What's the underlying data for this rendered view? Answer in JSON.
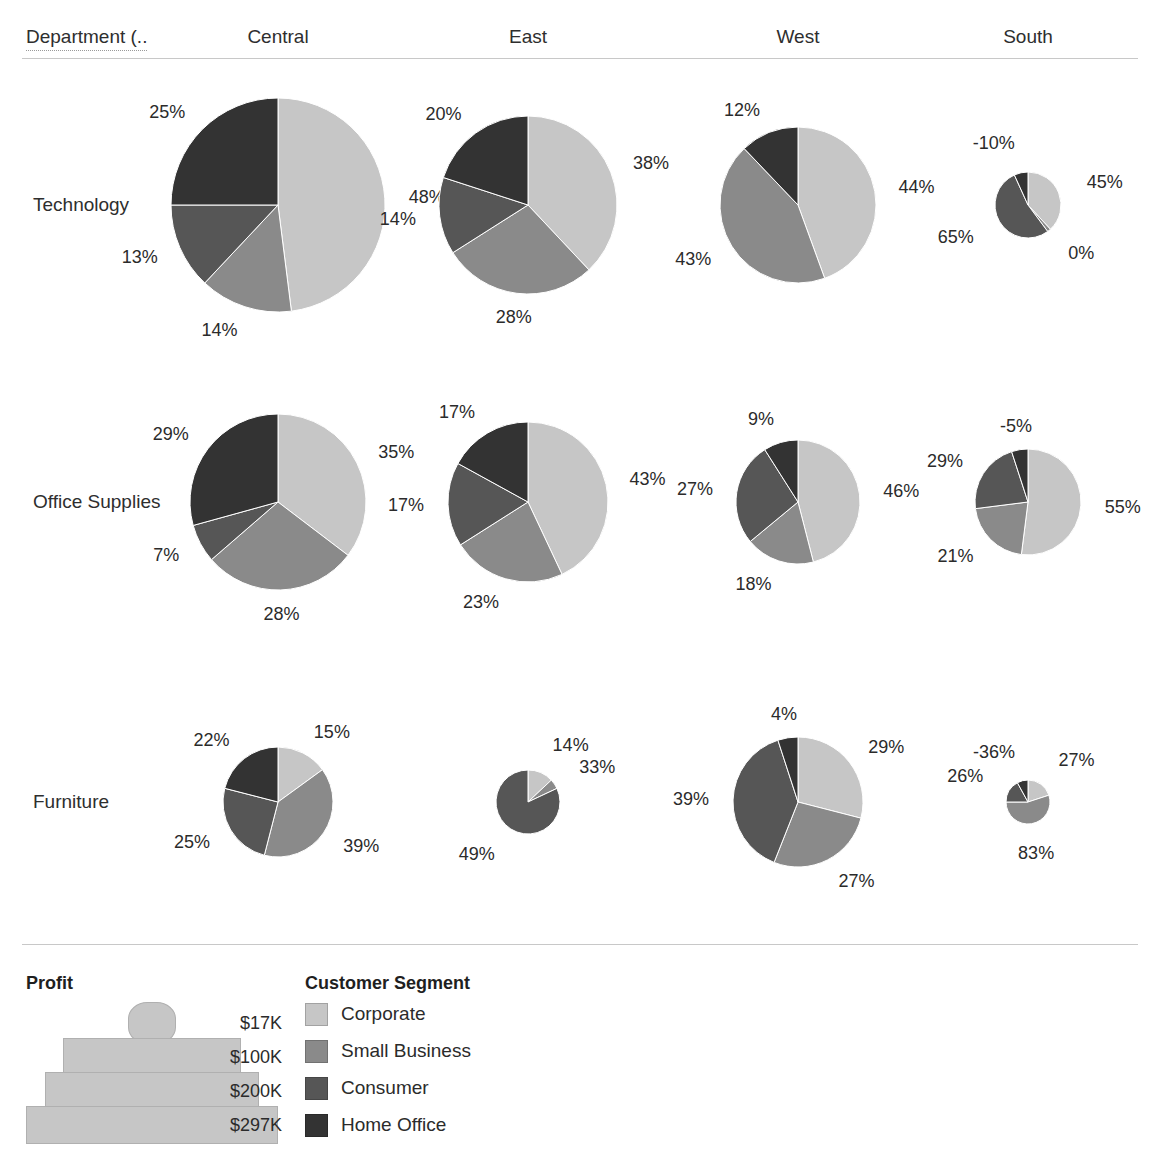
{
  "header": {
    "corner_label": "Department (..",
    "columns": [
      "Central",
      "East",
      "West",
      "South"
    ]
  },
  "rows": [
    "Technology",
    "Office Supplies",
    "Furniture"
  ],
  "legend": {
    "size_title": "Profit",
    "size_items": [
      {
        "value": "$17K",
        "width": 46,
        "height": 40,
        "round": true
      },
      {
        "value": "$100K",
        "width": 176,
        "height": 36,
        "round": false
      },
      {
        "value": "$200K",
        "width": 212,
        "height": 36,
        "round": false
      },
      {
        "value": "$297K",
        "width": 250,
        "height": 36,
        "round": false
      }
    ],
    "segment_title": "Customer Segment",
    "segment_items": [
      {
        "label": "Corporate",
        "color": "#c6c6c6"
      },
      {
        "label": "Small Business",
        "color": "#8a8a8a"
      },
      {
        "label": "Consumer",
        "color": "#565656"
      },
      {
        "label": "Home Office",
        "color": "#333333"
      }
    ]
  },
  "chart_data": {
    "type": "pie",
    "title": "",
    "row_field": "Department",
    "column_field": "Region",
    "size_field": "Profit",
    "color_field": "Customer Segment",
    "categories": [
      "Corporate",
      "Small Business",
      "Consumer",
      "Home Office"
    ],
    "colors": [
      "#c6c6c6",
      "#8a8a8a",
      "#565656",
      "#333333"
    ],
    "columns": [
      "Central",
      "East",
      "West",
      "South"
    ],
    "rows": [
      "Technology",
      "Office Supplies",
      "Furniture"
    ],
    "panels": [
      {
        "row": "Technology",
        "column": "Central",
        "radius": 107,
        "slices": [
          {
            "segment": "Corporate",
            "label": "48%",
            "value": 48
          },
          {
            "segment": "Small Business",
            "label": "14%",
            "value": 14
          },
          {
            "segment": "Consumer",
            "label": "13%",
            "value": 13
          },
          {
            "segment": "Home Office",
            "label": "25%",
            "value": 25
          }
        ]
      },
      {
        "row": "Technology",
        "column": "East",
        "radius": 89,
        "slices": [
          {
            "segment": "Corporate",
            "label": "38%",
            "value": 38
          },
          {
            "segment": "Small Business",
            "label": "28%",
            "value": 28
          },
          {
            "segment": "Consumer",
            "label": "14%",
            "value": 14
          },
          {
            "segment": "Home Office",
            "label": "20%",
            "value": 20
          }
        ]
      },
      {
        "row": "Technology",
        "column": "West",
        "radius": 78,
        "slices": [
          {
            "segment": "Corporate",
            "label": "44%",
            "value": 44
          },
          {
            "segment": "Small Business",
            "label": "43%",
            "value": 43
          },
          {
            "segment": "Home Office",
            "label": "12%",
            "value": 12
          }
        ]
      },
      {
        "row": "Technology",
        "column": "South",
        "radius": 33,
        "slices": [
          {
            "segment": "Corporate",
            "label": "45%",
            "value": 45
          },
          {
            "segment": "Small Business",
            "label": "0%",
            "value": 2
          },
          {
            "segment": "Consumer",
            "label": "65%",
            "value": 63
          },
          {
            "segment": "Home Office",
            "label": "-10%",
            "value": 8
          }
        ]
      },
      {
        "row": "Office Supplies",
        "column": "Central",
        "radius": 88,
        "slices": [
          {
            "segment": "Corporate",
            "label": "35%",
            "value": 35
          },
          {
            "segment": "Small Business",
            "label": "28%",
            "value": 28
          },
          {
            "segment": "Consumer",
            "label": "7%",
            "value": 7
          },
          {
            "segment": "Home Office",
            "label": "29%",
            "value": 29
          }
        ]
      },
      {
        "row": "Office Supplies",
        "column": "East",
        "radius": 80,
        "slices": [
          {
            "segment": "Corporate",
            "label": "43%",
            "value": 43
          },
          {
            "segment": "Small Business",
            "label": "23%",
            "value": 23
          },
          {
            "segment": "Consumer",
            "label": "17%",
            "value": 17
          },
          {
            "segment": "Home Office",
            "label": "17%",
            "value": 17
          }
        ]
      },
      {
        "row": "Office Supplies",
        "column": "West",
        "radius": 62,
        "slices": [
          {
            "segment": "Corporate",
            "label": "46%",
            "value": 46
          },
          {
            "segment": "Small Business",
            "label": "18%",
            "value": 18
          },
          {
            "segment": "Consumer",
            "label": "27%",
            "value": 27
          },
          {
            "segment": "Home Office",
            "label": "9%",
            "value": 9
          }
        ]
      },
      {
        "row": "Office Supplies",
        "column": "South",
        "radius": 53,
        "slices": [
          {
            "segment": "Corporate",
            "label": "55%",
            "value": 52
          },
          {
            "segment": "Small Business",
            "label": "21%",
            "value": 21
          },
          {
            "segment": "Consumer",
            "label": "29%",
            "value": 22
          },
          {
            "segment": "Home Office",
            "label": "-5%",
            "value": 5
          }
        ]
      },
      {
        "row": "Furniture",
        "column": "Central",
        "radius": 55,
        "slices": [
          {
            "segment": "Corporate",
            "label": "15%",
            "value": 15
          },
          {
            "segment": "Small Business",
            "label": "39%",
            "value": 39
          },
          {
            "segment": "Consumer",
            "label": "25%",
            "value": 25
          },
          {
            "segment": "Home Office",
            "label": "22%",
            "value": 21
          }
        ]
      },
      {
        "row": "Furniture",
        "column": "East",
        "radius": 32,
        "slices": [
          {
            "segment": "Corporate",
            "label": "14%",
            "value": 13
          },
          {
            "segment": "Small Business",
            "label": "33%",
            "value": 5
          },
          {
            "segment": "Consumer",
            "label": "49%",
            "value": 82
          }
        ]
      },
      {
        "row": "Furniture",
        "column": "West",
        "radius": 65,
        "slices": [
          {
            "segment": "Corporate",
            "label": "29%",
            "value": 29
          },
          {
            "segment": "Small Business",
            "label": "27%",
            "value": 27
          },
          {
            "segment": "Consumer",
            "label": "39%",
            "value": 39
          },
          {
            "segment": "Home Office",
            "label": "4%",
            "value": 5
          }
        ]
      },
      {
        "row": "Furniture",
        "column": "South",
        "radius": 22,
        "slices": [
          {
            "segment": "Corporate",
            "label": "27%",
            "value": 20
          },
          {
            "segment": "Small Business",
            "label": "83%",
            "value": 55
          },
          {
            "segment": "Consumer",
            "label": "26%",
            "value": 17
          },
          {
            "segment": "Home Office",
            "label": "-36%",
            "value": 8
          }
        ]
      }
    ],
    "layout": {
      "column_centers": [
        278,
        528,
        798,
        1028
      ],
      "row_centers": [
        205,
        502,
        802
      ]
    }
  }
}
